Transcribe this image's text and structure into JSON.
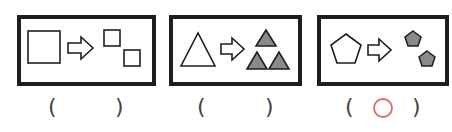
{
  "panels": [
    {
      "id": "square",
      "source_shape": "large square",
      "target_shapes": "two small squares",
      "fill": "none"
    },
    {
      "id": "triangle",
      "source_shape": "large triangle",
      "target_shapes": "three small gray triangles",
      "fill": "#8a8a8a"
    },
    {
      "id": "pentagon",
      "source_shape": "large pentagon",
      "target_shapes": "two small gray pentagons",
      "fill": "#8a8a8a"
    }
  ],
  "answers": [
    {
      "open": "(",
      "close": ")",
      "mark": ""
    },
    {
      "open": "(",
      "close": ")",
      "mark": ""
    },
    {
      "open": "(",
      "close": ")",
      "mark": "circle"
    }
  ],
  "colors": {
    "border": "#1e1e1e",
    "shape_fill": "#8a8a8a",
    "mark": "#e06a6a",
    "paren": "#444444"
  }
}
